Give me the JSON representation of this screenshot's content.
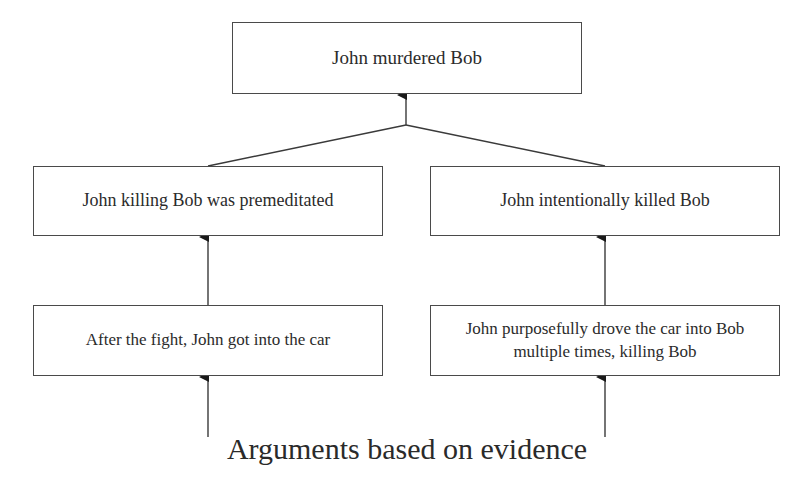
{
  "diagram": {
    "type": "argument-tree",
    "colors": {
      "line": "#3a3a3a",
      "text": "#2b2b2b",
      "background": "#ffffff"
    },
    "nodes": {
      "top": {
        "label": "John murdered Bob"
      },
      "mid_left": {
        "label": "John killing Bob was premeditated"
      },
      "mid_right": {
        "label": "John intentionally killed Bob"
      },
      "bot_left": {
        "label": "After the fight, John got into the car"
      },
      "bot_right": {
        "label": "John purposefully drove the car into Bob multiple times, killing Bob"
      }
    },
    "edges": [
      {
        "from": "mid_left",
        "to": "top"
      },
      {
        "from": "mid_right",
        "to": "top"
      },
      {
        "from": "bot_left",
        "to": "mid_left"
      },
      {
        "from": "bot_right",
        "to": "mid_right"
      },
      {
        "from": "evidence",
        "to": "bot_left"
      },
      {
        "from": "evidence",
        "to": "bot_right"
      }
    ],
    "caption": "Arguments based on evidence"
  }
}
